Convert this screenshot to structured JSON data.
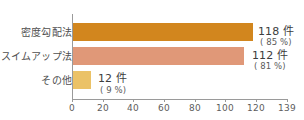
{
  "chart_data": {
    "type": "bar",
    "orientation": "horizontal",
    "title": "",
    "subtitle": "",
    "xlabel": "",
    "ylabel": "",
    "categories": [
      "密度勾配法",
      "スイムアップ法",
      "その他"
    ],
    "values": [
      118,
      112,
      12
    ],
    "percentages": [
      85,
      81,
      9
    ],
    "value_labels": [
      "118 件",
      "112 件",
      "12 件"
    ],
    "percent_labels": [
      "( 85 %)",
      "( 81 %)",
      "( 9 %)"
    ],
    "colors": [
      "#D2861E",
      "#E09878",
      "#EBC267"
    ],
    "xlim": [
      0,
      140
    ],
    "xticks": [
      0,
      20,
      40,
      60,
      80,
      100,
      120,
      139
    ],
    "xtick_labels": [
      "0",
      "20",
      "40",
      "60",
      "80",
      "100",
      "120",
      "139"
    ],
    "grid": false,
    "legend": "none",
    "background": "#ffffff",
    "axis_color": "#9a9a9a"
  }
}
